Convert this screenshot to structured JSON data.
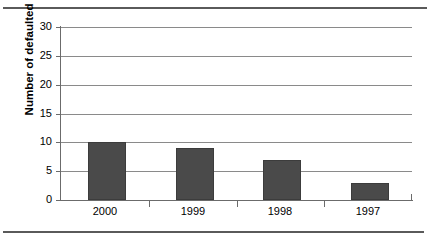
{
  "chart_data": {
    "type": "bar",
    "title": "",
    "xlabel": "",
    "ylabel": "Number of defaulted issues",
    "categories": [
      "2000",
      "1999",
      "1998",
      "1997"
    ],
    "values": [
      10,
      9,
      7,
      3
    ],
    "ylim": [
      0,
      30
    ],
    "yticks": [
      0,
      5,
      10,
      15,
      20,
      25,
      30
    ],
    "ytick_labels": [
      "0",
      "5",
      "10",
      "15",
      "20",
      "25",
      "30"
    ],
    "grid": "horizontal",
    "legend": "none",
    "bar_color": "#4a4a4a",
    "gridline_color": "#8a8a8a",
    "axis_color": "#6b6b6b",
    "rule_color": "#5a5a5a"
  }
}
